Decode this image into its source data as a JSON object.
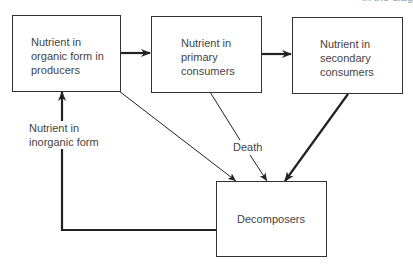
{
  "header_fragment": "in the diag",
  "nodes": {
    "producers": {
      "label": "Nutrient in organic form in producers"
    },
    "primary": {
      "label": "Nutrient in primary consumers"
    },
    "secondary": {
      "label": "Nutrient in secondary consumers"
    },
    "decomposers": {
      "label": "Decomposers"
    }
  },
  "edge_labels": {
    "death": "Death",
    "inorganic": "Nutrient in inorganic form"
  },
  "edges": [
    {
      "from": "producers",
      "to": "primary",
      "style": "thick"
    },
    {
      "from": "primary",
      "to": "secondary",
      "style": "thick"
    },
    {
      "from": "producers",
      "to": "decomposers",
      "style": "thin"
    },
    {
      "from": "primary",
      "to": "decomposers",
      "style": "thin",
      "label": "Death"
    },
    {
      "from": "secondary",
      "to": "decomposers",
      "style": "thick"
    },
    {
      "from": "decomposers",
      "to": "producers",
      "style": "thick",
      "label": "Nutrient in inorganic form"
    }
  ],
  "colors": {
    "line": "#222222",
    "text": "#444444"
  }
}
